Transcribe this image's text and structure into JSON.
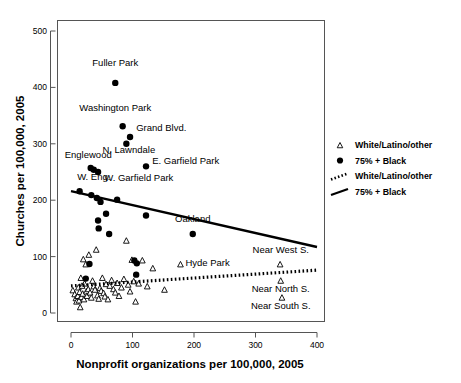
{
  "chart_data": {
    "type": "scatter",
    "title": "",
    "xlabel": "Nonprofit organizations per 100,000, 2005",
    "ylabel": "Churches per 100,000, 2005",
    "xlim": [
      -20,
      420
    ],
    "ylim": [
      -22,
      530
    ],
    "xticks": [
      0,
      100,
      200,
      300,
      400
    ],
    "yticks": [
      0,
      100,
      200,
      300,
      400,
      500
    ],
    "xticklabels": [
      "0",
      "100",
      "200",
      "300",
      "400"
    ],
    "yticklabels": [
      "0",
      "100",
      "200",
      "300",
      "400",
      "500"
    ],
    "grid": false,
    "legend_position": "right-outside",
    "series": [
      {
        "name": "White/Latino/other",
        "marker": "open-triangle",
        "points": [
          {
            "x": 3,
            "y": 40
          },
          {
            "x": 6,
            "y": 33
          },
          {
            "x": 8,
            "y": 26
          },
          {
            "x": 9,
            "y": 20
          },
          {
            "x": 11,
            "y": 30
          },
          {
            "x": 12,
            "y": 45
          },
          {
            "x": 13,
            "y": 22
          },
          {
            "x": 14,
            "y": 37
          },
          {
            "x": 15,
            "y": 10
          },
          {
            "x": 16,
            "y": 62
          },
          {
            "x": 17,
            "y": 28
          },
          {
            "x": 18,
            "y": 48
          },
          {
            "x": 19,
            "y": 34
          },
          {
            "x": 20,
            "y": 95
          },
          {
            "x": 21,
            "y": 24
          },
          {
            "x": 22,
            "y": 52
          },
          {
            "x": 24,
            "y": 86
          },
          {
            "x": 25,
            "y": 38
          },
          {
            "x": 26,
            "y": 30
          },
          {
            "x": 28,
            "y": 42
          },
          {
            "x": 29,
            "y": 103
          },
          {
            "x": 31,
            "y": 36
          },
          {
            "x": 33,
            "y": 27
          },
          {
            "x": 35,
            "y": 57
          },
          {
            "x": 37,
            "y": 47
          },
          {
            "x": 39,
            "y": 41
          },
          {
            "x": 41,
            "y": 112
          },
          {
            "x": 43,
            "y": 31
          },
          {
            "x": 45,
            "y": 25
          },
          {
            "x": 47,
            "y": 44
          },
          {
            "x": 49,
            "y": 39
          },
          {
            "x": 51,
            "y": 62
          },
          {
            "x": 53,
            "y": 35
          },
          {
            "x": 55,
            "y": 29
          },
          {
            "x": 57,
            "y": 51
          },
          {
            "x": 60,
            "y": 24
          },
          {
            "x": 63,
            "y": 48
          },
          {
            "x": 66,
            "y": 58
          },
          {
            "x": 69,
            "y": 42
          },
          {
            "x": 72,
            "y": 36
          },
          {
            "x": 75,
            "y": 53
          },
          {
            "x": 78,
            "y": 30
          },
          {
            "x": 82,
            "y": 45
          },
          {
            "x": 86,
            "y": 60
          },
          {
            "x": 90,
            "y": 128
          },
          {
            "x": 93,
            "y": 50
          },
          {
            "x": 96,
            "y": 38
          },
          {
            "x": 99,
            "y": 94
          },
          {
            "x": 102,
            "y": 56
          },
          {
            "x": 105,
            "y": 20
          },
          {
            "x": 110,
            "y": 52
          },
          {
            "x": 116,
            "y": 93
          },
          {
            "x": 124,
            "y": 47
          },
          {
            "x": 133,
            "y": 79
          },
          {
            "x": 152,
            "y": 41
          },
          {
            "x": 178,
            "y": 86
          },
          {
            "x": 340,
            "y": 86
          },
          {
            "x": 341,
            "y": 57
          },
          {
            "x": 343,
            "y": 27
          }
        ]
      },
      {
        "name": "75% + Black",
        "marker": "filled-circle",
        "points": [
          {
            "x": 72,
            "y": 408
          },
          {
            "x": 84,
            "y": 331
          },
          {
            "x": 96,
            "y": 312
          },
          {
            "x": 90,
            "y": 300
          },
          {
            "x": 32,
            "y": 257
          },
          {
            "x": 37,
            "y": 254
          },
          {
            "x": 44,
            "y": 250
          },
          {
            "x": 122,
            "y": 260
          },
          {
            "x": 14,
            "y": 216
          },
          {
            "x": 33,
            "y": 209
          },
          {
            "x": 42,
            "y": 204
          },
          {
            "x": 48,
            "y": 197
          },
          {
            "x": 75,
            "y": 201
          },
          {
            "x": 57,
            "y": 176
          },
          {
            "x": 122,
            "y": 173
          },
          {
            "x": 44,
            "y": 164
          },
          {
            "x": 45,
            "y": 150
          },
          {
            "x": 62,
            "y": 140
          },
          {
            "x": 198,
            "y": 140
          },
          {
            "x": 30,
            "y": 87
          },
          {
            "x": 103,
            "y": 93
          },
          {
            "x": 107,
            "y": 88
          },
          {
            "x": 24,
            "y": 61
          },
          {
            "x": 106,
            "y": 68
          }
        ]
      }
    ],
    "fit_lines": [
      {
        "name": "75% + Black",
        "style": "solid",
        "x_start": 0,
        "y_start": 216,
        "x_end": 400,
        "y_end": 117
      },
      {
        "name": "White/Latino/other",
        "style": "dotted",
        "x_start": 0,
        "y_start": 48,
        "x_end": 400,
        "y_end": 76
      }
    ],
    "annotations": [
      {
        "text": "Fuller Park",
        "x": 72,
        "y": 438,
        "anchor": "middle"
      },
      {
        "text": "Washington Park",
        "x": 72,
        "y": 358,
        "anchor": "middle"
      },
      {
        "text": "Grand Blvd.",
        "x": 106,
        "y": 322,
        "anchor": "start"
      },
      {
        "text": "N. Lawndale",
        "x": 94,
        "y": 283,
        "anchor": "middle"
      },
      {
        "text": "Englewood",
        "x": 28,
        "y": 274,
        "anchor": "middle"
      },
      {
        "text": "E. Garfield Park",
        "x": 132,
        "y": 264,
        "anchor": "start"
      },
      {
        "text": "W. Eng.",
        "x": 10,
        "y": 236,
        "anchor": "start"
      },
      {
        "text": "W. Garfield Park",
        "x": 54,
        "y": 234,
        "anchor": "start"
      },
      {
        "text": "Oakland",
        "x": 198,
        "y": 162,
        "anchor": "middle"
      },
      {
        "text": "Hyde Park",
        "x": 186,
        "y": 84,
        "anchor": "start"
      },
      {
        "text": "Near West S.",
        "x": 341,
        "y": 106,
        "anchor": "middle"
      },
      {
        "text": "Near North S.",
        "x": 341,
        "y": 37,
        "anchor": "middle"
      },
      {
        "text": "Near South S.",
        "x": 341,
        "y": 7,
        "anchor": "middle"
      }
    ],
    "legend_entries": [
      {
        "label": "White/Latino/other",
        "symbol": "open-triangle"
      },
      {
        "label": "75% + Black",
        "symbol": "filled-circle"
      },
      {
        "label": "White/Latino/other",
        "symbol": "dotted-line"
      },
      {
        "label": "75% + Black",
        "symbol": "solid-line"
      }
    ]
  }
}
